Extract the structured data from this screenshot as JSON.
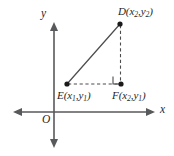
{
  "figure": {
    "background_color": "#ffffff",
    "line_color": "#4d4d4f",
    "axis_color": "#58595b",
    "point_color": "#1a1a1a",
    "width": 174,
    "height": 156
  },
  "axes": {
    "x_axis_label": "x",
    "y_axis_label": "y",
    "origin_label": "O",
    "x_axis_y_px": 112,
    "y_axis_x_px": 54,
    "x_axis_start_px": 13,
    "x_axis_end_px": 155,
    "y_axis_start_px": 22,
    "y_axis_end_px": 148,
    "arrowheads": "both-ends"
  },
  "points": [
    {
      "id": "D",
      "label_letter": "D",
      "coord_x": "x",
      "coord_x_sub": "2",
      "coord_y": "y",
      "coord_y_sub": "2",
      "label_text": "D(x2,y2)",
      "px": 120,
      "py": 24
    },
    {
      "id": "E",
      "label_letter": "E",
      "coord_x": "x",
      "coord_x_sub": "1",
      "coord_y": "y",
      "coord_y_sub": "1",
      "label_text": "E(x1,y1)",
      "px": 67,
      "py": 84
    },
    {
      "id": "F",
      "label_letter": "F",
      "coord_x": "x",
      "coord_x_sub": "2",
      "coord_y": "y",
      "coord_y_sub": "1",
      "label_text": "F(x2,y1)",
      "px": 121,
      "py": 84
    }
  ],
  "segments": [
    {
      "id": "DE",
      "from": "E",
      "to": "D",
      "style": "solid",
      "role": "hypotenuse"
    },
    {
      "id": "DF",
      "from": "D",
      "to": "F",
      "style": "dashed",
      "role": "vertical-leg"
    },
    {
      "id": "EF",
      "from": "E",
      "to": "F",
      "style": "dashed",
      "role": "horizontal-leg"
    }
  ],
  "right_angle": {
    "at_point": "F",
    "marker": "square",
    "size_px": 8
  }
}
